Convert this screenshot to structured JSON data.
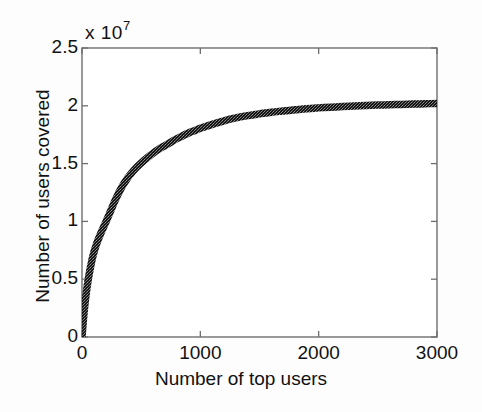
{
  "chart_data": {
    "type": "line",
    "title": "",
    "subtitle": "",
    "xlabel": "Number of top users",
    "ylabel": "Number of users covered",
    "y_multiplier_text": "x 10",
    "y_multiplier_exponent": "7",
    "y_multiplier_value": 10000000,
    "xlim": [
      0,
      3000
    ],
    "ylim": [
      0,
      25000000
    ],
    "xticks": [
      0,
      1000,
      2000,
      3000
    ],
    "xticklabels": [
      "0",
      "1000",
      "2000",
      "3000"
    ],
    "yticks": [
      0,
      5000000,
      10000000,
      15000000,
      20000000,
      25000000
    ],
    "yticklabels": [
      "0",
      "0.5",
      "1",
      "1.5",
      "2",
      "2.5"
    ],
    "grid": false,
    "legend": false,
    "legend_position": "none",
    "line_color": "#1a1a1a",
    "marker": "dotted-dense",
    "series": [
      {
        "name": "users covered",
        "x": [
          0,
          10,
          20,
          30,
          40,
          50,
          60,
          70,
          80,
          90,
          100,
          120,
          140,
          160,
          180,
          200,
          225,
          250,
          275,
          300,
          325,
          350,
          375,
          400,
          450,
          500,
          550,
          600,
          650,
          700,
          750,
          800,
          850,
          900,
          950,
          1000,
          1100,
          1200,
          1300,
          1400,
          1500,
          1600,
          1700,
          1800,
          1900,
          2000,
          2100,
          2200,
          2300,
          2400,
          2500,
          2600,
          2700,
          2800,
          2900,
          3000
        ],
        "values": [
          0,
          1300000,
          2400000,
          3300000,
          4100000,
          4800000,
          5400000,
          5950000,
          6450000,
          6900000,
          7300000,
          7950000,
          8500000,
          9000000,
          9450000,
          9900000,
          10500000,
          11100000,
          11700000,
          12250000,
          12750000,
          13200000,
          13600000,
          13950000,
          14550000,
          15050000,
          15500000,
          15900000,
          16250000,
          16550000,
          16850000,
          17150000,
          17400000,
          17650000,
          17850000,
          18050000,
          18400000,
          18700000,
          18950000,
          19150000,
          19300000,
          19450000,
          19550000,
          19650000,
          19750000,
          19820000,
          19880000,
          19930000,
          19980000,
          20020000,
          20060000,
          20090000,
          20120000,
          20150000,
          20180000,
          20200000
        ]
      }
    ],
    "annotations": []
  },
  "axes": {
    "box_color": "#6e6e6e",
    "background": "#ffffff"
  }
}
